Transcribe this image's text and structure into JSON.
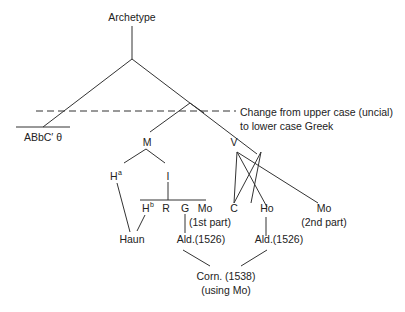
{
  "diagram": {
    "type": "stemma",
    "nodes": {
      "archetype": "Archetype",
      "abbc": "ABbC′ θ",
      "M": "M",
      "V": "V",
      "Ha": "H",
      "Ha_sup": "a",
      "I": "I",
      "Hb": "H",
      "Hb_sup": "b",
      "R": "R",
      "G": "G",
      "Mo1": "Mo",
      "Mo1_note": "(1st part)",
      "C": "C",
      "Ho": "Ho",
      "Mo2": "Mo",
      "Mo2_note": "(2nd part)",
      "Haun": "Haun",
      "Ald1": "Ald.(1526)",
      "Ald2": "Ald.(1526)",
      "Corn": "Corn. (1538)",
      "Corn_note": "(using Mo)"
    },
    "annotation": {
      "line1": "Change from upper case (uncial)",
      "line2": "to lower case Greek"
    },
    "edges": [
      [
        "archetype",
        "abbc"
      ],
      [
        "archetype",
        "split"
      ],
      [
        "split",
        "M"
      ],
      [
        "split",
        "V"
      ],
      [
        "M",
        "Ha"
      ],
      [
        "M",
        "I"
      ],
      [
        "I",
        "Hb/R/G/Mo1"
      ],
      [
        "Ha",
        "Haun"
      ],
      [
        "Hb",
        "Haun"
      ],
      [
        "G",
        "Ald1"
      ],
      [
        "V",
        "C"
      ],
      [
        "V",
        "Ho"
      ],
      [
        "V",
        "Mo2"
      ],
      [
        "Ho",
        "Ald2"
      ],
      [
        "Ald1",
        "Corn"
      ],
      [
        "Ald2",
        "Corn"
      ]
    ]
  }
}
